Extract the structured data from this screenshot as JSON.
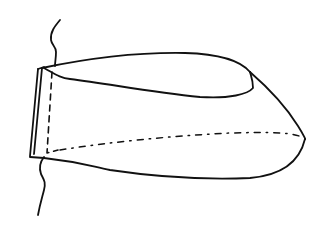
{
  "diagram": {
    "type": "line-sketch",
    "colors": {
      "background": "#ffffff",
      "ink": "#111111"
    },
    "elements": [
      {
        "name": "wall-break-line-top",
        "style": "wavy solid"
      },
      {
        "name": "wall-break-line-bottom",
        "style": "wavy solid"
      },
      {
        "name": "base-plate",
        "style": "double solid parallelogram"
      },
      {
        "name": "hidden-edge-vertical",
        "style": "dashed"
      },
      {
        "name": "top-outline",
        "style": "solid"
      },
      {
        "name": "inner-upper-curve",
        "style": "solid"
      },
      {
        "name": "tip-outline",
        "style": "solid"
      },
      {
        "name": "bottom-outline",
        "style": "solid"
      },
      {
        "name": "center-line",
        "style": "dash-dot"
      }
    ],
    "labels": []
  }
}
